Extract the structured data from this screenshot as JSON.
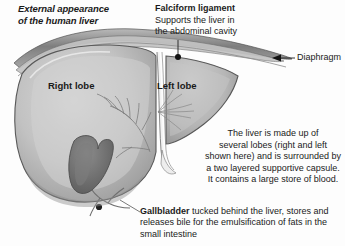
{
  "figure": {
    "title": "External appearance of the human liver",
    "title_line1": "External appearance",
    "title_line2": "of the human liver",
    "background_color": "#fdfdfd"
  },
  "labels": {
    "falciform": {
      "heading": "Falciform ligament",
      "description_line1": "Supports the liver in",
      "description_line2": "the abdominal cavity",
      "description": "Supports the liver in the abdominal cavity",
      "marker": "leader-dot"
    },
    "diaphragm": {
      "text": "Diaphragm",
      "marker": "left-arrow"
    },
    "right_lobe": {
      "text": "Right lobe"
    },
    "left_lobe": {
      "text": "Left lobe"
    },
    "gallbladder": {
      "heading": "Gallbladder",
      "body": " tucked behind the liver, stores and releases bile for the emulsification of fats in the small intestine",
      "line1": "Gallbladder tucked behind the liver, stores",
      "line2": "and releases bile for the emulsification of",
      "line3": "fats in the small intestine"
    }
  },
  "description": {
    "line1": "The liver is made up of",
    "line2": "several lobes (right and left",
    "line3": "shown here) and is surrounded by",
    "line4": "a two layered supportive capsule.",
    "line5": "It contains a large store of blood.",
    "full": "The liver is made up of several lobes (right and left shown here) and is surrounded by a two layered supportive capsule. It contains a large store of blood."
  },
  "colors": {
    "liver_light": "#c9c9c9",
    "liver_mid": "#b4b4b4",
    "liver_dark": "#9a9a9a",
    "liver_shadow": "#868686",
    "gallbladder": "#6f6f6f",
    "diaphragm_band": "#8f8f8f",
    "outline": "#4a4a4a",
    "text": "#1a1a1a",
    "background": "#fdfdfd"
  }
}
